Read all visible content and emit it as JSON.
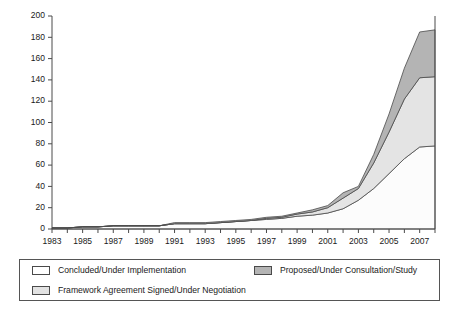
{
  "chart_data": {
    "type": "area",
    "stacked": true,
    "title": "",
    "xlabel": "",
    "ylabel": "",
    "ylim": [
      0,
      200
    ],
    "xlim": [
      1983,
      2008
    ],
    "ytick_values": [
      0,
      20,
      40,
      60,
      80,
      100,
      120,
      140,
      160,
      180,
      200
    ],
    "ytick_labels": [
      "0",
      "20",
      "40",
      "60",
      "80",
      "100",
      "120",
      "140",
      "160",
      "180",
      "200"
    ],
    "xtick_labels": [
      "1983",
      "1985",
      "1987",
      "1989",
      "1991",
      "1993",
      "1995",
      "1997",
      "1999",
      "2001",
      "2003",
      "2005",
      "2007"
    ],
    "xtick_values": [
      1983,
      1985,
      1987,
      1989,
      1991,
      1993,
      1995,
      1997,
      1999,
      2001,
      2003,
      2005,
      2007
    ],
    "grid": false,
    "legend_position": "below",
    "x": [
      1983,
      1984,
      1985,
      1986,
      1987,
      1988,
      1989,
      1990,
      1991,
      1992,
      1993,
      1994,
      1995,
      1996,
      1997,
      1998,
      1999,
      2000,
      2001,
      2002,
      2003,
      2004,
      2005,
      2006,
      2007,
      2008
    ],
    "series": [
      {
        "name": "Concluded/Under Implementation",
        "color": "#fcfcfc",
        "values": [
          1,
          1,
          2,
          2,
          3,
          3,
          3,
          3,
          5,
          5,
          5,
          6,
          7,
          8,
          9,
          10,
          12,
          13,
          15,
          19,
          27,
          38,
          52,
          66,
          77,
          78
        ]
      },
      {
        "name": "Framework Agreement Signed/Under Negotiation",
        "color": "#e4e4e4",
        "values": [
          0,
          0,
          0,
          0,
          0,
          0,
          0,
          0,
          0,
          0,
          0,
          0,
          0,
          0,
          1,
          1,
          2,
          3,
          5,
          10,
          11,
          24,
          39,
          56,
          65,
          65
        ]
      },
      {
        "name": "Proposed/Under Consultation/Study",
        "color": "#b4b4b4",
        "values": [
          0,
          0,
          0,
          0,
          0,
          0,
          0,
          0,
          1,
          1,
          1,
          1,
          1,
          1,
          1,
          1,
          1,
          2,
          2,
          5,
          2,
          8,
          17,
          29,
          43,
          44
        ]
      }
    ],
    "cumulative_totals": [
      1,
      1,
      2,
      2,
      3,
      3,
      3,
      3,
      6,
      6,
      6,
      7,
      8,
      9,
      11,
      12,
      15,
      18,
      22,
      34,
      40,
      70,
      108,
      151,
      185,
      187
    ]
  },
  "legend": {
    "entries": [
      {
        "label": "Concluded/Under Implementation",
        "swatch": "sw-concluded"
      },
      {
        "label": "Proposed/Under Consultation/Study",
        "swatch": "sw-proposed"
      },
      {
        "label": "Framework Agreement Signed/Under Negotiation",
        "swatch": "sw-framework"
      }
    ]
  }
}
